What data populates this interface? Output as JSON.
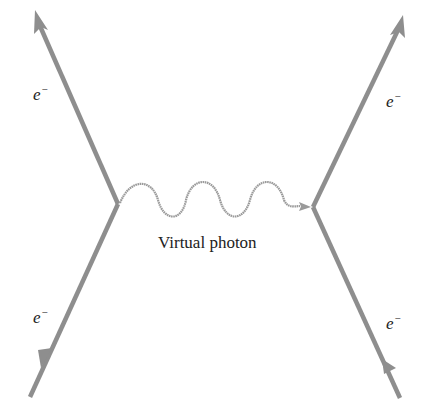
{
  "diagram": {
    "title": "",
    "colors": {
      "electron_line": "#8e8e8e",
      "photon_line": "#9a9a9a",
      "text": "#222222",
      "background": "#ffffff"
    },
    "labels": {
      "top_left": {
        "base": "e",
        "sup": "−"
      },
      "top_right": {
        "base": "e",
        "sup": "−"
      },
      "bottom_left": {
        "base": "e",
        "sup": "−"
      },
      "bottom_right": {
        "base": "e",
        "sup": "−"
      },
      "photon": "Virtual photon"
    },
    "nodes": [
      {
        "id": "vertex-left",
        "x": 118,
        "y": 204
      },
      {
        "id": "vertex-right",
        "x": 313,
        "y": 207
      }
    ],
    "edges": [
      {
        "id": "electron-in-left",
        "type": "electron",
        "from": [
          30,
          397
        ],
        "to": [
          118,
          204
        ],
        "arrow_at": [
          45,
          360
        ]
      },
      {
        "id": "electron-out-left",
        "type": "electron",
        "from": [
          118,
          204
        ],
        "to": [
          35,
          10
        ],
        "arrow_at": [
          35,
          10
        ]
      },
      {
        "id": "electron-in-right",
        "type": "electron",
        "from": [
          400,
          398
        ],
        "to": [
          313,
          207
        ],
        "arrow_at": [
          388,
          372
        ]
      },
      {
        "id": "electron-out-right",
        "type": "electron",
        "from": [
          313,
          207
        ],
        "to": [
          403,
          15
        ],
        "arrow_at": [
          403,
          15
        ]
      },
      {
        "id": "virtual-photon",
        "type": "photon",
        "from": [
          118,
          204
        ],
        "to": [
          313,
          207
        ],
        "arrow_at": [
          300,
          206
        ]
      }
    ]
  }
}
